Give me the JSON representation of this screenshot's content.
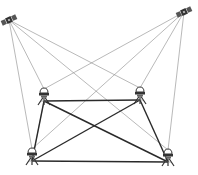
{
  "diagram": {
    "type": "gnss-baseline-network",
    "satellites": [
      {
        "id": "sat-1",
        "x": 9,
        "y": 20
      },
      {
        "id": "sat-2",
        "x": 184,
        "y": 12
      }
    ],
    "receivers": [
      {
        "id": "rx-top-left",
        "x": 44,
        "y": 97
      },
      {
        "id": "rx-top-right",
        "x": 140,
        "y": 96
      },
      {
        "id": "rx-bottom-left",
        "x": 32,
        "y": 157
      },
      {
        "id": "rx-bottom-right",
        "x": 168,
        "y": 158
      }
    ],
    "signal_lines": [
      {
        "from": "sat-1",
        "to": "rx-top-left"
      },
      {
        "from": "sat-1",
        "to": "rx-top-right"
      },
      {
        "from": "sat-1",
        "to": "rx-bottom-left"
      },
      {
        "from": "sat-1",
        "to": "rx-bottom-right"
      },
      {
        "from": "sat-2",
        "to": "rx-top-left"
      },
      {
        "from": "sat-2",
        "to": "rx-top-right"
      },
      {
        "from": "sat-2",
        "to": "rx-bottom-left"
      },
      {
        "from": "sat-2",
        "to": "rx-bottom-right"
      }
    ],
    "baselines": [
      {
        "from": "rx-top-left",
        "to": "rx-top-right"
      },
      {
        "from": "rx-top-left",
        "to": "rx-bottom-left"
      },
      {
        "from": "rx-top-left",
        "to": "rx-bottom-right"
      },
      {
        "from": "rx-top-right",
        "to": "rx-bottom-left"
      },
      {
        "from": "rx-top-right",
        "to": "rx-bottom-right"
      },
      {
        "from": "rx-bottom-left",
        "to": "rx-bottom-right"
      }
    ],
    "colors": {
      "signal_line": "#8a8a8a",
      "baseline": "#2a2a2a",
      "icon": "#333333"
    }
  }
}
